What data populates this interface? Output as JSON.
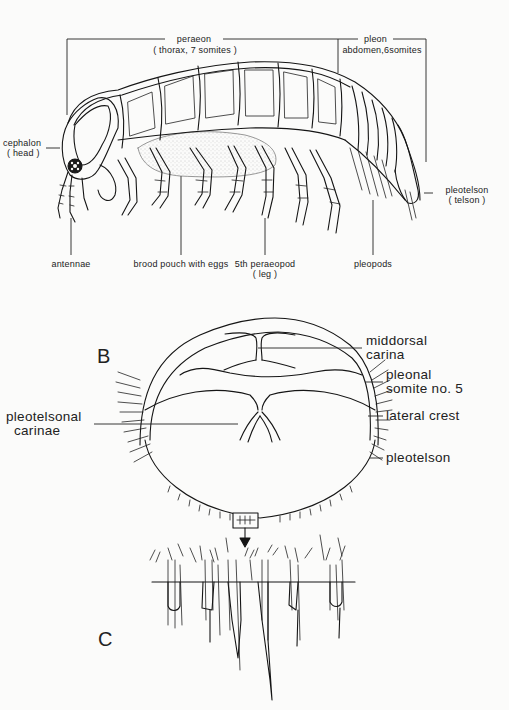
{
  "figure": {
    "panel_a": {
      "subject": "isopod lateral view",
      "brackets": {
        "peraeon": {
          "line1": "peraeon",
          "line2": "( thorax, 7 somites )"
        },
        "pleon": {
          "line1": "pleon",
          "line2": "abdomen,6somites"
        }
      },
      "side_labels": {
        "cephalon": {
          "line1": "cephalon",
          "line2": "( head )"
        },
        "pleotelson": {
          "line1": "pleotelson",
          "line2": "( telson )"
        }
      },
      "bottom_labels": [
        {
          "line1": "antennae"
        },
        {
          "line1": "brood pouch with eggs"
        },
        {
          "line1": "5th peraeopod",
          "line2": "( leg )"
        },
        {
          "line1": "pleopods"
        }
      ]
    },
    "panel_b": {
      "letter": "B",
      "subject": "pleotelson dorsal view",
      "right_labels": [
        {
          "line1": "middorsal",
          "line2": "carina"
        },
        {
          "line1": "pleonal",
          "line2": "somite no. 5"
        },
        {
          "line1": "lateral crest"
        },
        {
          "line1": "pleotelson"
        }
      ],
      "left_labels": [
        {
          "line1": "pleotelsonal",
          "line2": "carinae"
        }
      ]
    },
    "panel_c": {
      "letter": "C",
      "subject": "enlarged posterior margin setae"
    },
    "colors": {
      "ink": "#151515",
      "paper": "#fbfbfa",
      "stipple": "#9a9a9a"
    }
  }
}
